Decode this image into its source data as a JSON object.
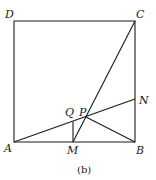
{
  "diagram": {
    "caption": "(b)",
    "points": {
      "A": {
        "label": "A",
        "x": 14,
        "y": 142
      },
      "B": {
        "label": "B",
        "x": 135,
        "y": 142
      },
      "C": {
        "label": "C",
        "x": 135,
        "y": 21
      },
      "D": {
        "label": "D",
        "x": 14,
        "y": 21
      },
      "N": {
        "label": "N",
        "x": 135,
        "y": 99
      },
      "M": {
        "label": "M",
        "x": 73,
        "y": 142
      },
      "Q": {
        "label": "Q",
        "x": 73,
        "y": 122
      },
      "P": {
        "label": "P",
        "x": 86,
        "y": 117
      }
    },
    "segments": [
      "AB",
      "BC",
      "CD",
      "DA",
      "CM",
      "AN",
      "PB",
      "QM"
    ]
  }
}
